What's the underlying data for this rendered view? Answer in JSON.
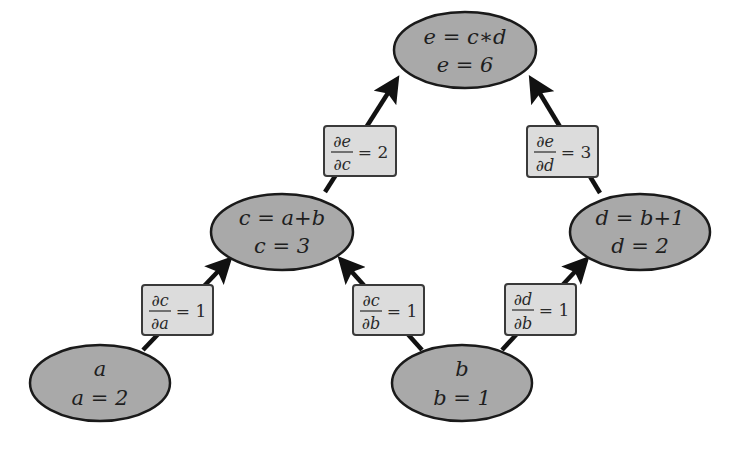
{
  "diagram": {
    "title": "",
    "type": "computational-graph",
    "colors": {
      "node_fill": "#a9a9a9",
      "node_stroke": "#1a1a1a",
      "label_fill": "#dcdcdc",
      "label_stroke": "#3a3a3a",
      "arrow": "#111111"
    },
    "nodes": [
      {
        "id": "e",
        "line1": "e = c∗d",
        "line2": "e = 6",
        "cx": 465,
        "cy": 50
      },
      {
        "id": "c",
        "line1": "c = a+b",
        "line2": "c = 3",
        "cx": 282,
        "cy": 232
      },
      {
        "id": "d",
        "line1": "d = b+1",
        "line2": "d = 2",
        "cx": 640,
        "cy": 232
      },
      {
        "id": "a",
        "line1": "a",
        "line2": "a = 2",
        "cx": 100,
        "cy": 380
      },
      {
        "id": "b",
        "line1": "b",
        "line2": "b = 1",
        "cx": 462,
        "cy": 380
      }
    ],
    "edges": [
      {
        "from": "c",
        "to": "e",
        "numerator": "∂e",
        "denominator": "∂c",
        "value": "= 2"
      },
      {
        "from": "d",
        "to": "e",
        "numerator": "∂e",
        "denominator": "∂d",
        "value": "= 3"
      },
      {
        "from": "a",
        "to": "c",
        "numerator": "∂c",
        "denominator": "∂a",
        "value": "= 1"
      },
      {
        "from": "b",
        "to": "c",
        "numerator": "∂c",
        "denominator": "∂b",
        "value": "= 1"
      },
      {
        "from": "b",
        "to": "d",
        "numerator": "∂d",
        "denominator": "∂b",
        "value": "= 1"
      }
    ]
  }
}
